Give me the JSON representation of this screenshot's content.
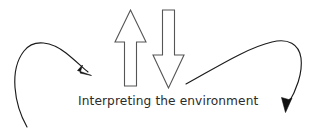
{
  "diagram": {
    "title": "Interpreting the environment",
    "caption": {
      "text": "Interpreting the environment",
      "color": "#2b2b2b"
    },
    "background_color": "#ffffff",
    "line_color": "#1a1a1a",
    "block_arrow_fill": "#ffffff",
    "block_arrow_stroke": "#555555",
    "elements": [
      {
        "name": "left-curved-arrow",
        "label": "",
        "direction": "clockwise-inward",
        "points_to": "center"
      },
      {
        "name": "up-block-arrow",
        "label": "",
        "direction": "up"
      },
      {
        "name": "down-block-arrow",
        "label": "",
        "direction": "down"
      },
      {
        "name": "right-curved-arrow",
        "label": "",
        "direction": "counterclockwise-outward",
        "points_to": "bottom-right"
      }
    ]
  }
}
